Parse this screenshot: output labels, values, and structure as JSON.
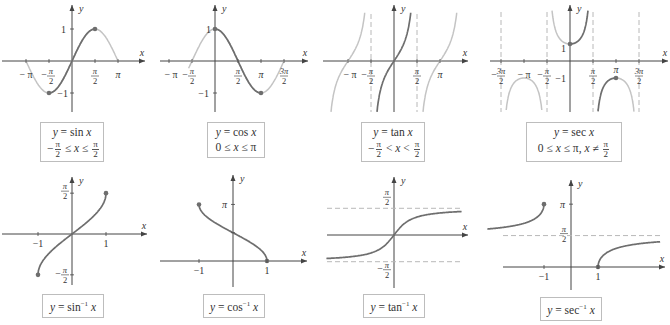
{
  "colors": {
    "main_curve": "#6e6e6e",
    "faded_curve": "#c4c4c4",
    "axis": "#444444",
    "asymptote": "#b8b8b8",
    "point": "#6e6e6e",
    "caption_border": "#bdbdbd"
  },
  "axis_labels": {
    "x": "x",
    "y": "y"
  },
  "chart_data": [
    {
      "type": "line",
      "id": "sin",
      "caption": {
        "line1": "y = sin x",
        "line2": "−π/2 ≤ x ≤ π/2"
      },
      "function": "sin x",
      "restricted_domain": [
        "-pi/2",
        "pi/2"
      ],
      "endpoints": [
        [
          "-pi/2",
          -1
        ],
        [
          "pi/2",
          1
        ]
      ],
      "x_ticks": [
        "−π",
        "−π/2",
        "π/2",
        "π"
      ],
      "y_ticks": [
        "1",
        "−1"
      ],
      "xlim": [
        "-3pi/2",
        "3pi/2"
      ]
    },
    {
      "type": "line",
      "id": "cos",
      "caption": {
        "line1": "y = cos x",
        "line2": "0 ≤ x ≤ π"
      },
      "function": "cos x",
      "restricted_domain": [
        "0",
        "pi"
      ],
      "endpoints": [
        [
          "0",
          1
        ],
        [
          "pi",
          -1
        ]
      ],
      "x_ticks": [
        "−π",
        "−π/2",
        "π/2",
        "π",
        "3π/2"
      ],
      "y_ticks": [
        "1",
        "−1"
      ]
    },
    {
      "type": "line",
      "id": "tan",
      "caption": {
        "line1": "y = tan x",
        "line2": "−π/2 < x < π/2"
      },
      "function": "tan x",
      "restricted_domain": [
        "-pi/2",
        "pi/2"
      ],
      "asymptotes_x": [
        "-pi/2",
        "pi/2"
      ],
      "x_ticks": [
        "−π",
        "−π/2",
        "π/2",
        "π"
      ]
    },
    {
      "type": "line",
      "id": "sec",
      "caption": {
        "line1": "y = sec x",
        "line2": "0 ≤ x ≤ π, x ≠ π/2"
      },
      "function": "sec x",
      "restricted_domain": [
        "0",
        "pi"
      ],
      "endpoints": [
        [
          "0",
          1
        ],
        [
          "pi",
          -1
        ]
      ],
      "asymptotes_x": [
        "-3pi/2",
        "-pi/2",
        "pi/2",
        "3pi/2"
      ],
      "x_ticks": [
        "−3π/2",
        "−π",
        "−π/2",
        "π/2",
        "π",
        "3π/2"
      ],
      "y_ticks": [
        "1",
        "−1"
      ]
    },
    {
      "type": "line",
      "id": "asin",
      "caption": {
        "line1": "y = sin⁻¹ x"
      },
      "function": "arcsin x",
      "domain": [
        -1,
        1
      ],
      "endpoints": [
        [
          -1,
          "-pi/2"
        ],
        [
          1,
          "pi/2"
        ]
      ],
      "x_ticks": [
        "−1",
        "1"
      ],
      "y_ticks": [
        "π/2",
        "−π/2"
      ]
    },
    {
      "type": "line",
      "id": "acos",
      "caption": {
        "line1": "y = cos⁻¹ x"
      },
      "function": "arccos x",
      "domain": [
        -1,
        1
      ],
      "endpoints": [
        [
          -1,
          "pi"
        ],
        [
          1,
          0
        ]
      ],
      "x_ticks": [
        "−1",
        "1"
      ],
      "y_ticks": [
        "π"
      ]
    },
    {
      "type": "line",
      "id": "atan",
      "caption": {
        "line1": "y = tan⁻¹ x"
      },
      "function": "arctan x",
      "asymptotes_y": [
        "pi/2",
        "-pi/2"
      ],
      "y_ticks": [
        "π/2",
        "−π/2"
      ]
    },
    {
      "type": "line",
      "id": "asec",
      "caption": {
        "line1": "y = sec⁻¹ x"
      },
      "function": "arcsec x",
      "endpoints": [
        [
          -1,
          "pi"
        ],
        [
          1,
          0
        ]
      ],
      "asymptotes_y": [
        "pi/2"
      ],
      "x_ticks": [
        "−1",
        "1"
      ],
      "y_ticks": [
        "π",
        "π/2"
      ]
    }
  ]
}
